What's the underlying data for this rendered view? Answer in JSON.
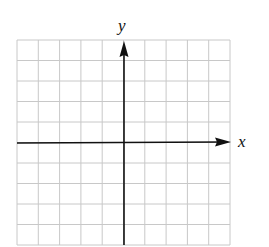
{
  "diagram": {
    "type": "coordinate-grid",
    "grid": {
      "columns": 10,
      "rows": 10,
      "line_color": "#c8c8c8",
      "axis_color": "#111111"
    },
    "origin": {
      "col": 5,
      "row": 4
    },
    "x_axis_label": "x",
    "y_axis_label": "y"
  }
}
